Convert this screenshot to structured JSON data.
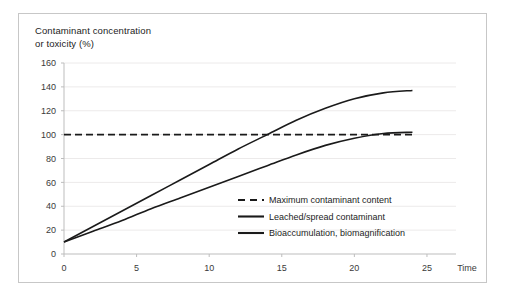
{
  "chart_data": {
    "type": "line",
    "title": "Contaminant concentration\nor  toxicity (%)",
    "xlabel": "Time",
    "ylabel": "Contaminant concentration or toxicity (%)",
    "xlim": [
      0,
      27
    ],
    "ylim": [
      0,
      160
    ],
    "xticks": [
      "0",
      "5",
      "10",
      "15",
      "20",
      "25"
    ],
    "xtick_values": [
      0,
      5,
      10,
      15,
      20,
      25
    ],
    "yticks": [
      "0",
      "20",
      "40",
      "60",
      "80",
      "100",
      "120",
      "140",
      "160"
    ],
    "ytick_values": [
      0,
      20,
      40,
      60,
      80,
      100,
      120,
      140,
      160
    ],
    "grid": "horizontal",
    "legend_position": "center-right-inside",
    "series": [
      {
        "name": "Maximum contaminant content",
        "style": "dashed",
        "color": "#1a1a1a",
        "x": [
          0,
          24
        ],
        "values": [
          100,
          100
        ]
      },
      {
        "name": "Leached/spread contaminant",
        "style": "solid",
        "color": "#1a1a1a",
        "x": [
          0,
          2,
          4,
          6,
          8,
          10,
          12,
          14,
          16,
          18,
          20,
          22,
          24
        ],
        "values": [
          10,
          23,
          36,
          49,
          62,
          75,
          88,
          100,
          112,
          122,
          130,
          135,
          137
        ]
      },
      {
        "name": "Bioaccumulation, biomagnification",
        "style": "solid",
        "color": "#1a1a1a",
        "x": [
          0,
          2,
          4,
          6,
          8,
          10,
          12,
          14,
          16,
          18,
          20,
          22,
          24
        ],
        "values": [
          10,
          19,
          28,
          38,
          47,
          56,
          65,
          74,
          83,
          91,
          97,
          101,
          102
        ]
      }
    ]
  },
  "legend": {
    "items": [
      {
        "label": "Maximum contaminant content",
        "style": "dashed"
      },
      {
        "label": "Leached/spread contaminant",
        "style": "solid"
      },
      {
        "label": "Bioaccumulation, biomagnification",
        "style": "solid"
      }
    ]
  },
  "colors": {
    "line": "#1a1a1a",
    "grid": "#eceaea",
    "axis": "#bdbdbd",
    "border": "#c7c7c7",
    "text": "#1c1c1c"
  }
}
